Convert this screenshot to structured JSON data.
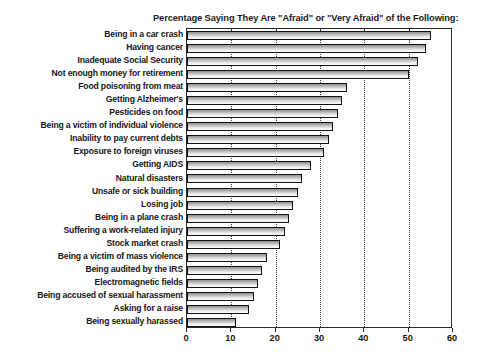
{
  "top_artifact": "                                                                    ",
  "chart_data": {
    "type": "bar",
    "orientation": "horizontal",
    "title": "Percentage Saying They Are \"Afraid\" or \"Very Afraid\" of the Following:",
    "xlabel": "",
    "ylabel": "",
    "xlim": [
      0,
      60
    ],
    "xticks": [
      0,
      10,
      20,
      30,
      40,
      50,
      60
    ],
    "xticklabels": [
      "0",
      "10",
      "20",
      "30",
      "40",
      "50",
      "60"
    ],
    "grid": "vertical-dotted",
    "legend": "none",
    "bar_color": "#bfbfbf",
    "bar_edge_color": "#111111",
    "categories": [
      "Being in a car crash",
      "Having cancer",
      "Inadequate Social Security",
      "Not enough money for retirement",
      "Food poisoning from meat",
      "Getting Alzheimer's",
      "Pesticides on food",
      "Being a victim of individual violence",
      "Inability to pay current debts",
      "Exposure to foreign viruses",
      "Getting AIDS",
      "Natural disasters",
      "Unsafe or sick building",
      "Losing job",
      "Being in a plane crash",
      "Suffering a work-related injury",
      "Stock market crash",
      "Being a victim of mass violence",
      "Being audited by the IRS",
      "Electromagnetic fields",
      "Being accused of sexual harassment",
      "Asking for a raise",
      "Being sexually harassed"
    ],
    "values": [
      55,
      54,
      52,
      50,
      36,
      35,
      34,
      33,
      32,
      31,
      28,
      26,
      25,
      24,
      23,
      22,
      21,
      18,
      17,
      16,
      15,
      14,
      11
    ]
  }
}
